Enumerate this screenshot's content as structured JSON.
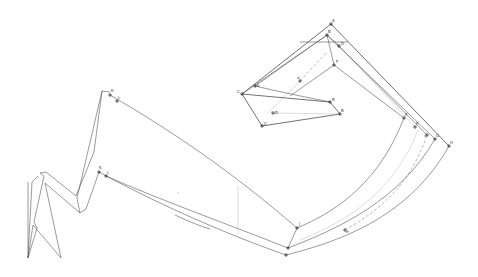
{
  "diagram": {
    "type": "pattern-draft-sketch",
    "background": "#ffffff",
    "line_color": "#555555",
    "point_labels": [
      {
        "id": "A",
        "x": 331,
        "y": 24
      },
      {
        "id": "B",
        "x": 327,
        "y": 35
      },
      {
        "id": "D",
        "x": 339,
        "y": 46
      },
      {
        "id": "F",
        "x": 334,
        "y": 65
      },
      {
        "id": "a",
        "x": 300,
        "y": 81
      },
      {
        "id": "b",
        "x": 255,
        "y": 86
      },
      {
        "id": "C",
        "x": 242,
        "y": 94
      },
      {
        "id": "B2",
        "x": 330,
        "y": 102
      },
      {
        "id": "D2",
        "x": 273,
        "y": 113
      },
      {
        "id": "B3",
        "x": 340,
        "y": 114
      },
      {
        "id": "C2",
        "x": 262,
        "y": 126
      },
      {
        "id": "E",
        "x": 404,
        "y": 118
      },
      {
        "id": "E2",
        "x": 415,
        "y": 127
      },
      {
        "id": "c",
        "x": 427,
        "y": 135
      },
      {
        "id": "G",
        "x": 435,
        "y": 139
      },
      {
        "id": "H",
        "x": 449,
        "y": 146
      },
      {
        "id": "K",
        "x": 110,
        "y": 95
      },
      {
        "id": "L",
        "x": 117,
        "y": 101
      },
      {
        "id": "K2",
        "x": 99,
        "y": 172
      },
      {
        "id": "L2",
        "x": 106,
        "y": 176
      },
      {
        "id": "J",
        "x": 297,
        "y": 228
      },
      {
        "id": "J2",
        "x": 288,
        "y": 248
      },
      {
        "id": "J3",
        "x": 286,
        "y": 255
      },
      {
        "id": "e",
        "x": 345,
        "y": 230
      }
    ]
  }
}
